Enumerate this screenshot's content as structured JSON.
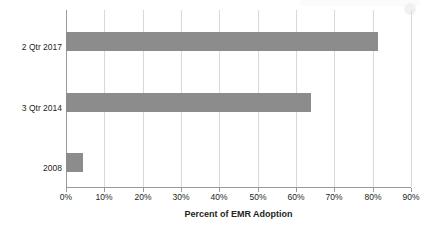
{
  "chart_data": {
    "type": "bar",
    "orientation": "horizontal",
    "title": "",
    "xlabel": "Percent of EMR Adoption",
    "ylabel": "",
    "categories": [
      "2 Qtr 2017",
      "3 Qtr 2014",
      "2008"
    ],
    "values": [
      81.5,
      64,
      4.5
    ],
    "value_unit": "%",
    "xlim": [
      0,
      90
    ],
    "xticks": [
      0,
      10,
      20,
      30,
      40,
      50,
      60,
      70,
      80,
      90
    ],
    "xtick_labels": [
      "0%",
      "10%",
      "20%",
      "30%",
      "40%",
      "50%",
      "60%",
      "70%",
      "80%",
      "90%"
    ],
    "grid": "vertical",
    "legend": "none",
    "bar_color": "#8c8c8c",
    "gridline_color": "#d9d9d9",
    "axis_color": "#9a9a9a",
    "background_color": "#ffffff",
    "series": [
      {
        "name": "Percent of EMR Adoption",
        "values": [
          81.5,
          64,
          4.5
        ]
      }
    ]
  }
}
